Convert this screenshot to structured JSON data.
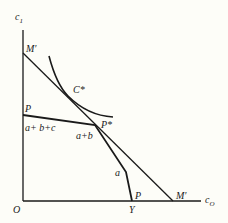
{
  "diagram": {
    "axes": {
      "y_label": "c",
      "y_label_sub": "1",
      "x_label": "c",
      "x_label_sub": "O",
      "origin_label": "O"
    },
    "labels": {
      "budget_line_top": "M′",
      "budget_line_bottom": "M′",
      "tangency_point": "C*",
      "production_kink": "P*",
      "production_left": "P",
      "production_right": "P",
      "endowment": "Y",
      "segment_abc": "a+ b+c",
      "segment_ab": "a+b",
      "segment_a": "a"
    },
    "colors": {
      "ink": "#1a1a1a",
      "background": "#fdfdf8"
    }
  }
}
